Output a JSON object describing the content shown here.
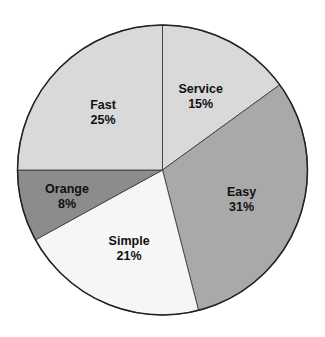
{
  "chart_data": {
    "type": "pie",
    "title": "",
    "start_angle_deg": 0,
    "direction": "clockwise",
    "slices": [
      {
        "label": "Service",
        "value": 15,
        "display": "15%",
        "color": "#d9d9d9"
      },
      {
        "label": "Easy",
        "value": 31,
        "display": "31%",
        "color": "#a9a9a9"
      },
      {
        "label": "Simple",
        "value": 21,
        "display": "21%",
        "color": "#f6f6f6"
      },
      {
        "label": "Orange",
        "value": 8,
        "display": "8%",
        "color": "#8c8c8c"
      },
      {
        "label": "Fast",
        "value": 25,
        "display": "25%",
        "color": "#d9d9d9"
      }
    ],
    "legend": "none",
    "labels_inside": true
  }
}
